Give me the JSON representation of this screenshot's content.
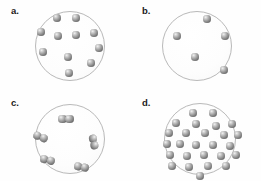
{
  "figure": {
    "title": "",
    "background_color": "#fefefe",
    "vessel_stroke_color": "#b9b9b9",
    "particle_color": "#818181",
    "label_color": "#1b1b1b"
  },
  "panels": [
    {
      "id": "a",
      "label": "a.",
      "label_x": 11,
      "label_y": 6,
      "vessel": {
        "cx": 70,
        "cy": 46,
        "r": 35
      },
      "particle_type": "monatomic",
      "particle_count": 11,
      "particle_radius": 4.1,
      "particles": [
        {
          "cx": 57,
          "cy": 18
        },
        {
          "cx": 76,
          "cy": 18
        },
        {
          "cx": 41,
          "cy": 32
        },
        {
          "cx": 58,
          "cy": 36
        },
        {
          "cx": 76,
          "cy": 35
        },
        {
          "cx": 94,
          "cy": 33
        },
        {
          "cx": 43,
          "cy": 52
        },
        {
          "cx": 68,
          "cy": 57
        },
        {
          "cx": 91,
          "cy": 63
        },
        {
          "cx": 69,
          "cy": 73
        },
        {
          "cx": 99,
          "cy": 48
        }
      ]
    },
    {
      "id": "b",
      "label": "b.",
      "label_x": 142,
      "label_y": 6,
      "vessel": {
        "cx": 197,
        "cy": 46,
        "r": 35
      },
      "particle_type": "monatomic",
      "particle_count": 5,
      "particle_radius": 4.1,
      "particles": [
        {
          "cx": 207,
          "cy": 19
        },
        {
          "cx": 177,
          "cy": 36
        },
        {
          "cx": 225,
          "cy": 36
        },
        {
          "cx": 195,
          "cy": 57
        },
        {
          "cx": 224,
          "cy": 70
        }
      ]
    },
    {
      "id": "c",
      "label": "c.",
      "label_x": 11,
      "label_y": 98,
      "vessel": {
        "cx": 70,
        "cy": 139,
        "r": 35
      },
      "particle_type": "diatomic",
      "particle_count": 5,
      "particle_radius": 4.1,
      "molecules": [
        {
          "cx": 66,
          "cy": 119,
          "angle": 0
        },
        {
          "cx": 41,
          "cy": 137,
          "angle": 22
        },
        {
          "cx": 94,
          "cy": 142,
          "angle": 78
        },
        {
          "cx": 48,
          "cy": 160,
          "angle": 14
        },
        {
          "cx": 82,
          "cy": 167,
          "angle": 10
        }
      ]
    },
    {
      "id": "d",
      "label": "d.",
      "label_x": 142,
      "label_y": 98,
      "vessel": {
        "cx": 200,
        "cy": 139,
        "r": 36
      },
      "particle_type": "monatomic",
      "particle_count": 26,
      "particle_radius": 4.1,
      "particles": [
        {
          "cx": 193,
          "cy": 113
        },
        {
          "cx": 213,
          "cy": 113
        },
        {
          "cx": 176,
          "cy": 123
        },
        {
          "cx": 196,
          "cy": 124
        },
        {
          "cx": 216,
          "cy": 126
        },
        {
          "cx": 232,
          "cy": 124
        },
        {
          "cx": 169,
          "cy": 133
        },
        {
          "cx": 186,
          "cy": 133
        },
        {
          "cx": 205,
          "cy": 133
        },
        {
          "cx": 224,
          "cy": 135
        },
        {
          "cx": 238,
          "cy": 135
        },
        {
          "cx": 167,
          "cy": 144
        },
        {
          "cx": 180,
          "cy": 144
        },
        {
          "cx": 196,
          "cy": 145
        },
        {
          "cx": 213,
          "cy": 145
        },
        {
          "cx": 230,
          "cy": 146
        },
        {
          "cx": 170,
          "cy": 155
        },
        {
          "cx": 187,
          "cy": 156
        },
        {
          "cx": 204,
          "cy": 155
        },
        {
          "cx": 221,
          "cy": 156
        },
        {
          "cx": 236,
          "cy": 155
        },
        {
          "cx": 172,
          "cy": 166
        },
        {
          "cx": 189,
          "cy": 167
        },
        {
          "cx": 208,
          "cy": 166
        },
        {
          "cx": 226,
          "cy": 166
        },
        {
          "cx": 200,
          "cy": 176
        }
      ]
    }
  ]
}
